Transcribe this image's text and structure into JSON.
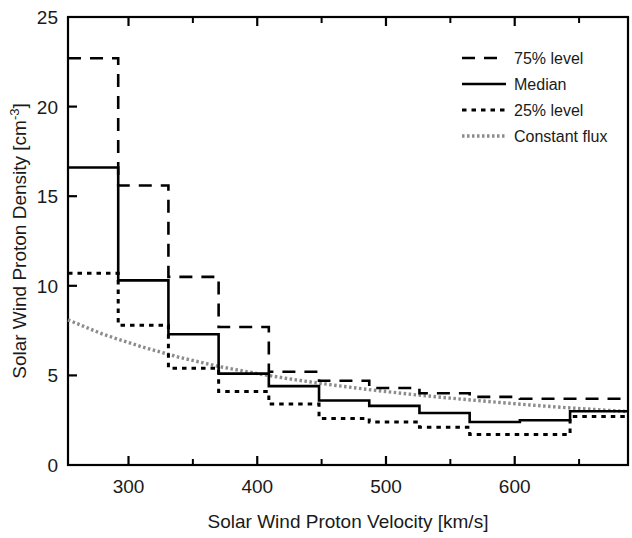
{
  "chart_data": {
    "type": "line",
    "title": "",
    "xlabel": "Solar Wind Proton Velocity [km/s]",
    "ylabel": "Solar Wind Proton Density [cm-3]",
    "ylabel_base": "Solar Wind Proton Density [cm",
    "ylabel_sup": "-3",
    "ylabel_tail": "]",
    "xlim": [
      253,
      688
    ],
    "ylim": [
      0,
      25
    ],
    "grid": false,
    "legend_position": "top-right",
    "x_ticks": [
      300,
      400,
      500,
      600
    ],
    "x_tick_labels": [
      "300",
      "400",
      "500",
      "600"
    ],
    "x_minor_ticks": [
      350,
      450,
      550,
      650
    ],
    "y_ticks": [
      0,
      5,
      10,
      15,
      20,
      25
    ],
    "y_tick_labels": [
      "0",
      "5",
      "10",
      "15",
      "20",
      "25"
    ],
    "bin_edges": [
      253,
      292,
      331,
      370,
      409,
      448,
      487,
      526,
      565,
      604,
      643,
      688
    ],
    "series": [
      {
        "name": "75% level",
        "style": "dashed",
        "color": "#000000",
        "values": [
          22.7,
          15.6,
          10.5,
          7.7,
          5.2,
          4.7,
          4.3,
          4.0,
          3.8,
          3.7,
          3.7
        ]
      },
      {
        "name": "Median",
        "style": "solid",
        "color": "#000000",
        "values": [
          16.6,
          10.3,
          7.3,
          5.1,
          4.4,
          3.6,
          3.3,
          2.9,
          2.4,
          2.5,
          3.0
        ]
      },
      {
        "name": "25% level",
        "style": "dotted",
        "color": "#000000",
        "values": [
          10.7,
          7.8,
          5.4,
          4.1,
          3.4,
          2.6,
          2.4,
          2.1,
          1.7,
          1.7,
          2.7
        ]
      },
      {
        "name": "Constant flux",
        "style": "constant-flux",
        "color": "#8c8c8c",
        "x": [
          253,
          280,
          310,
          340,
          370,
          400,
          430,
          460,
          490,
          520,
          550,
          580,
          610,
          640,
          670,
          688
        ],
        "y": [
          8.1,
          7.3,
          6.6,
          6.0,
          5.5,
          5.1,
          4.75,
          4.45,
          4.18,
          3.94,
          3.73,
          3.54,
          3.36,
          3.2,
          3.06,
          2.98
        ]
      }
    ],
    "legend": [
      {
        "label": "75% level",
        "style": "dashed"
      },
      {
        "label": "Median",
        "style": "solid"
      },
      {
        "label": "25% level",
        "style": "dotted"
      },
      {
        "label": "Constant flux",
        "style": "constant-flux"
      }
    ]
  }
}
